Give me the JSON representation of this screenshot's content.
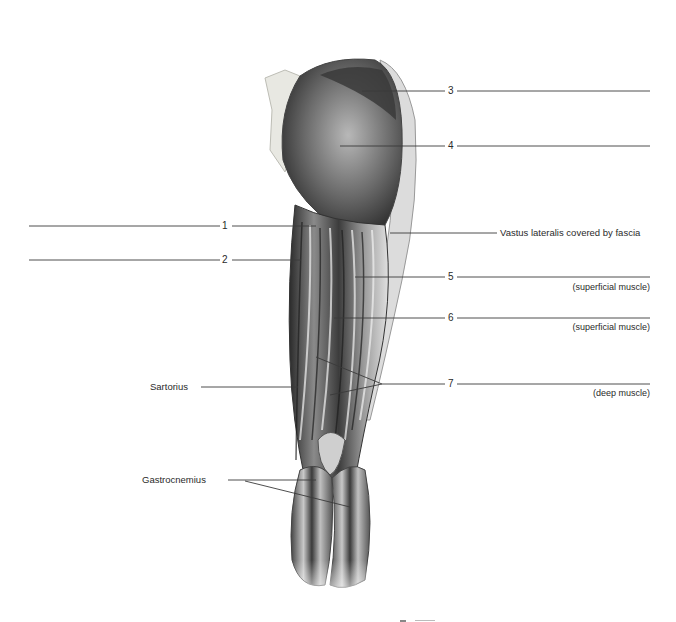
{
  "figure": {
    "numbered_labels": [
      {
        "number": "1",
        "answer_line": true
      },
      {
        "number": "2",
        "answer_line": true
      },
      {
        "number": "3",
        "answer_line": true
      },
      {
        "number": "4",
        "answer_line": true
      },
      {
        "number": "5",
        "answer_line": true,
        "note": "(superficial muscle)"
      },
      {
        "number": "6",
        "answer_line": true,
        "note": "(superficial muscle)"
      },
      {
        "number": "7",
        "answer_line": true,
        "note": "(deep muscle)"
      }
    ],
    "named_labels": {
      "vastus": "Vastus lateralis covered by fascia",
      "sartorius": "Sartorius",
      "gastrocnemius": "Gastrocnemius"
    },
    "colors": {
      "line": "#3a3a3a",
      "muscle_dark": "#2b2b2b",
      "muscle_mid": "#7a7a7a",
      "muscle_light": "#d8d8d8",
      "background": "#ffffff"
    }
  }
}
